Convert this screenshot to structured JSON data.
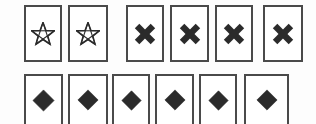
{
  "scene": {
    "title": "Card row symbol grid",
    "background_color": "#fdfdfd",
    "card_fill": "#ffffff",
    "card_border_color": "#4a4a4a",
    "symbol_color": "#2b2b2b",
    "width": 316,
    "height": 124
  },
  "rows": [
    {
      "name": "top-row",
      "label": "Top row",
      "cards": [
        {
          "symbol": "star",
          "symbol_label": "star-outline",
          "x": 24,
          "y": 5,
          "w": 38,
          "h": 57,
          "sym_w": 24,
          "sym_h": 24
        },
        {
          "symbol": "star",
          "symbol_label": "star-outline",
          "x": 68,
          "y": 5,
          "w": 40,
          "h": 57,
          "sym_w": 24,
          "sym_h": 24
        },
        {
          "symbol": "x",
          "symbol_label": "x-mark",
          "x": 126,
          "y": 5,
          "w": 38,
          "h": 57,
          "sym_w": 24,
          "sym_h": 24
        },
        {
          "symbol": "x",
          "symbol_label": "x-mark",
          "x": 170,
          "y": 5,
          "w": 39,
          "h": 57,
          "sym_w": 24,
          "sym_h": 24
        },
        {
          "symbol": "x",
          "symbol_label": "x-mark",
          "x": 215,
          "y": 5,
          "w": 38,
          "h": 57,
          "sym_w": 24,
          "sym_h": 24
        },
        {
          "symbol": "x",
          "symbol_label": "x-mark",
          "x": 263,
          "y": 5,
          "w": 40,
          "h": 57,
          "sym_w": 24,
          "sym_h": 24
        }
      ]
    },
    {
      "name": "bottom-row",
      "label": "Bottom row",
      "cards": [
        {
          "symbol": "diamond",
          "symbol_label": "diamond-filled",
          "x": 24,
          "y": 74,
          "w": 39,
          "h": 52,
          "sym_w": 23,
          "sym_h": 23
        },
        {
          "symbol": "diamond",
          "symbol_label": "diamond-filled",
          "x": 68,
          "y": 74,
          "w": 40,
          "h": 52,
          "sym_w": 22,
          "sym_h": 22
        },
        {
          "symbol": "diamond",
          "symbol_label": "diamond-filled",
          "x": 112,
          "y": 74,
          "w": 38,
          "h": 52,
          "sym_w": 21,
          "sym_h": 21
        },
        {
          "symbol": "diamond",
          "symbol_label": "diamond-filled",
          "x": 155,
          "y": 74,
          "w": 39,
          "h": 52,
          "sym_w": 22,
          "sym_h": 22
        },
        {
          "symbol": "diamond",
          "symbol_label": "diamond-filled",
          "x": 199,
          "y": 74,
          "w": 38,
          "h": 52,
          "sym_w": 21,
          "sym_h": 21
        },
        {
          "symbol": "diamond",
          "symbol_label": "diamond-filled",
          "x": 244,
          "y": 74,
          "w": 45,
          "h": 52,
          "sym_w": 22,
          "sym_h": 22
        }
      ]
    }
  ],
  "counts": {
    "star_cards": 2,
    "x_cards": 4,
    "diamond_cards": 6,
    "total_cards": 12
  }
}
